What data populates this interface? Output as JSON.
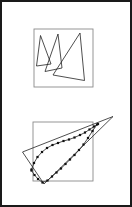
{
  "page": {
    "width": 132,
    "height": 207,
    "background_color": "#ffffff",
    "border_color": "#1a1a1a",
    "border_width": 2
  },
  "figure": {
    "title": "",
    "caption": "",
    "panel_count": 2
  },
  "style": {
    "outline_color": "#1a1a1a",
    "stroke_color": "#222222",
    "square_color": "#8a8a8a",
    "marker_color": "#111111",
    "stroke_width": 0.8,
    "square_stroke_width": 0.9,
    "marker_size": 2.2
  },
  "chart_data": {
    "type": "scatter",
    "title": "",
    "xlabel": "",
    "ylabel": "",
    "grid": false,
    "legend": null,
    "panels": [
      {
        "name": "top-panel",
        "label": "",
        "bounding_square": {
          "x": 34,
          "y": 29,
          "width": 59,
          "height": 58
        },
        "shapes": [
          {
            "name": "triangle-left",
            "type": "polygon",
            "closed": true,
            "markers": false,
            "points": [
              [
                40.5,
                35.5
              ],
              [
                36.5,
                66.0
              ],
              [
                51.0,
                64.0
              ]
            ]
          },
          {
            "name": "triangle-middle",
            "type": "polygon",
            "closed": true,
            "markers": false,
            "points": [
              [
                58.0,
                34.0
              ],
              [
                45.0,
                71.5
              ],
              [
                62.0,
                68.0
              ]
            ]
          },
          {
            "name": "triangle-right",
            "type": "polygon",
            "closed": true,
            "markers": false,
            "points": [
              [
                80.0,
                33.0
              ],
              [
                53.0,
                75.0
              ],
              [
                84.5,
                80.5
              ]
            ]
          }
        ]
      },
      {
        "name": "bottom-panel",
        "label": "",
        "bounding_square": {
          "x": 33,
          "y": 122,
          "width": 60,
          "height": 59
        },
        "shapes": [
          {
            "name": "outer-triangle",
            "type": "polygon",
            "closed": true,
            "markers": false,
            "points": [
              [
                22.5,
                152.0
              ],
              [
                113.0,
                116.5
              ],
              [
                44.0,
                184.0
              ]
            ]
          },
          {
            "name": "marked-upper-path",
            "type": "polyline",
            "closed": false,
            "markers": true,
            "points": [
              [
                31.5,
                169.5
              ],
              [
                34.0,
                163.0
              ],
              [
                37.5,
                157.0
              ],
              [
                42.0,
                152.0
              ],
              [
                47.0,
                148.0
              ],
              [
                52.5,
                145.0
              ],
              [
                58.0,
                143.0
              ],
              [
                63.5,
                141.0
              ],
              [
                69.0,
                139.5
              ],
              [
                74.5,
                137.5
              ],
              [
                80.0,
                135.0
              ],
              [
                85.0,
                132.5
              ],
              [
                89.5,
                129.5
              ],
              [
                94.0,
                126.5
              ],
              [
                98.0,
                124.0
              ]
            ]
          },
          {
            "name": "marked-lower-path",
            "type": "polyline",
            "closed": false,
            "markers": true,
            "points": [
              [
                31.5,
                170.5
              ],
              [
                34.5,
                175.0
              ],
              [
                38.0,
                179.0
              ],
              [
                42.5,
                182.5
              ],
              [
                47.5,
                180.5
              ],
              [
                52.0,
                176.5
              ],
              [
                56.5,
                172.5
              ],
              [
                61.0,
                168.5
              ],
              [
                65.5,
                164.0
              ],
              [
                70.0,
                159.5
              ],
              [
                74.5,
                155.0
              ],
              [
                79.0,
                150.0
              ],
              [
                83.5,
                144.5
              ],
              [
                88.0,
                138.0
              ],
              [
                92.5,
                131.0
              ],
              [
                97.0,
                124.5
              ]
            ]
          }
        ]
      }
    ]
  }
}
